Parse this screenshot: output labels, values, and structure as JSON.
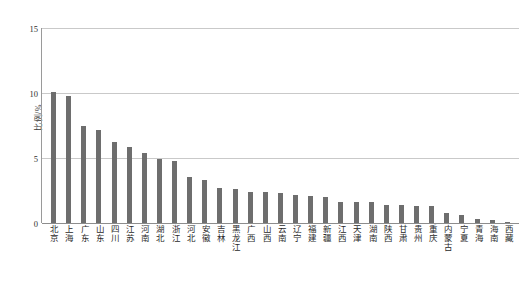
{
  "chart_data": {
    "type": "bar",
    "title": "",
    "subtitle": "",
    "xlabel": "",
    "ylabel": "比例/%",
    "ylim": [
      0,
      15
    ],
    "yticks": [
      0,
      5,
      10,
      15
    ],
    "ytick_labels": [
      "0",
      "5",
      "10",
      "15"
    ],
    "grid": true,
    "legend": false,
    "legend_position": "none",
    "orientation": "vertical",
    "bar_color": "#6e6e6e",
    "gridline_color": "#c9c9c9",
    "axis_color": "#8d8d8d",
    "categories": [
      "北京",
      "上海",
      "广东",
      "山东",
      "四川",
      "江苏",
      "河南",
      "湖北",
      "浙江",
      "河北",
      "安徽",
      "吉林",
      "黑龙江",
      "广西",
      "山西",
      "云南",
      "辽宁",
      "福建",
      "新疆",
      "江西",
      "天津",
      "湖南",
      "陕西",
      "甘肃",
      "贵州",
      "重庆",
      "内蒙古",
      "宁夏",
      "青海",
      "海南",
      "西藏"
    ],
    "values": [
      10.1,
      9.8,
      7.45,
      7.15,
      6.2,
      5.85,
      5.4,
      4.95,
      4.8,
      3.55,
      3.3,
      2.7,
      2.6,
      2.4,
      2.35,
      2.3,
      2.15,
      2.1,
      2.0,
      1.65,
      1.65,
      1.6,
      1.4,
      1.35,
      1.3,
      1.3,
      0.8,
      0.6,
      0.3,
      0.25,
      0.08
    ],
    "unit": "%"
  }
}
